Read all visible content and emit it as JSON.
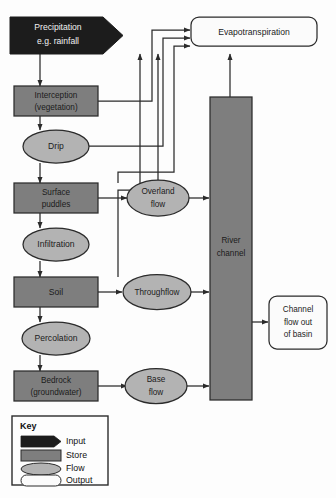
{
  "diagram": {
    "colors": {
      "input_fill": "#1c1c1c",
      "store_fill": "#7e7e7e",
      "flow_fill": "#b3b3b3",
      "output_fill": "#fbfbfb",
      "stroke": "#2b2b2b",
      "background": "#fdfdfd",
      "input_text": "#f2f2f2",
      "body_text": "#1b1b1b"
    },
    "nodes": {
      "precipitation": {
        "label_line1": "Precipitation",
        "label_line2": "e.g. rainfall",
        "type": "input"
      },
      "evapotranspiration": {
        "label": "Evapotranspiration",
        "type": "output"
      },
      "interception": {
        "label_line1": "Interception",
        "label_line2": "(vegetation)",
        "type": "store"
      },
      "drip": {
        "label": "Drip",
        "type": "flow"
      },
      "surface_puddles": {
        "label_line1": "Surface",
        "label_line2": "puddles",
        "type": "store"
      },
      "infiltration": {
        "label": "Infiltration",
        "type": "flow"
      },
      "soil": {
        "label": "Soil",
        "type": "store"
      },
      "percolation": {
        "label": "Percolation",
        "type": "flow"
      },
      "bedrock": {
        "label_line1": "Bedrock",
        "label_line2": "(groundwater)",
        "type": "store"
      },
      "overland_flow": {
        "label_line1": "Overland",
        "label_line2": "flow",
        "type": "flow"
      },
      "throughflow": {
        "label": "Throughflow",
        "type": "flow"
      },
      "base_flow": {
        "label_line1": "Base",
        "label_line2": "flow",
        "type": "flow"
      },
      "river_channel": {
        "label_line1": "River",
        "label_line2": "channel",
        "type": "store"
      },
      "channel_flow_out": {
        "label_line1": "Channel",
        "label_line2": "flow out",
        "label_line3": "of basin",
        "type": "output"
      }
    },
    "key": {
      "title": "Key",
      "items": [
        {
          "label": "Input",
          "type": "input"
        },
        {
          "label": "Store",
          "type": "store"
        },
        {
          "label": "Flow",
          "type": "flow"
        },
        {
          "label": "Output",
          "type": "output"
        }
      ]
    }
  }
}
